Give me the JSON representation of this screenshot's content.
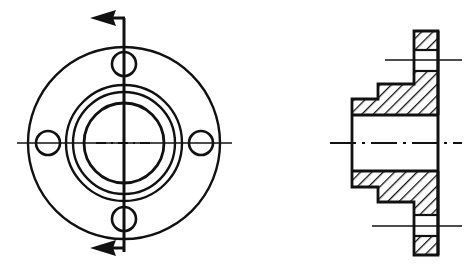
{
  "document": {
    "type": "engineering-drawing",
    "title": "Flanged Hub — Front View and Sectional View",
    "background_color": "#ffffff",
    "line_color": "#111111",
    "width": 465,
    "height": 269
  },
  "views": {
    "front": {
      "name": "front-view",
      "center": {
        "x": 124,
        "y": 143
      },
      "outer_flange_circle": {
        "cx": 124,
        "cy": 143,
        "r": 96
      },
      "concentric_circles": [
        {
          "cx": 124,
          "cy": 143,
          "r": 58
        },
        {
          "cx": 124,
          "cy": 143,
          "r": 51
        },
        {
          "cx": 124,
          "cy": 143,
          "r": 40
        }
      ],
      "bolt_holes": [
        {
          "name": "bolt-hole-top",
          "cx": 124,
          "cy": 64,
          "r": 12
        },
        {
          "name": "bolt-hole-bottom",
          "cx": 124,
          "cy": 219,
          "r": 12
        },
        {
          "name": "bolt-hole-left",
          "cx": 48,
          "cy": 143,
          "r": 12
        },
        {
          "name": "bolt-hole-right",
          "cx": 201,
          "cy": 143,
          "r": 12
        }
      ],
      "horizontal_centerline": {
        "x1": 17,
        "x2": 232,
        "y": 143
      },
      "vertical_dashdot_centerline": {
        "x": 124,
        "y1": 108,
        "y2": 180
      }
    },
    "section_cut": {
      "name": "section-cut-line",
      "line": {
        "x": 124,
        "y1": 18,
        "y2": 252
      },
      "arrow_direction": "left",
      "arrows": [
        {
          "name": "section-arrow-top",
          "tip_x": 95,
          "tail_x": 124,
          "y": 18
        },
        {
          "name": "section-arrow-bottom",
          "tip_x": 95,
          "tail_x": 124,
          "y": 248
        }
      ]
    },
    "section": {
      "name": "sectional-view",
      "center_y": 143,
      "face_plate_right_x": 438,
      "hub_left_x": 352,
      "hatch_angle_deg": 45,
      "centerline": {
        "x1": 330,
        "x2": 462,
        "y": 143
      },
      "bolt_hole_centerlines": [
        {
          "name": "section-bolthole-centerline-top",
          "x1": 385,
          "x2": 462,
          "y": 60
        },
        {
          "name": "section-bolthole-centerline-bottom",
          "x1": 372,
          "x2": 462,
          "y": 226
        }
      ],
      "bolt_hole_gaps": [
        {
          "name": "section-bolthole-gap-top",
          "x1": 415,
          "x2": 438,
          "y1": 50,
          "y2": 71
        },
        {
          "name": "section-bolthole-gap-bottom",
          "x1": 415,
          "x2": 438,
          "y1": 215,
          "y2": 236
        }
      ],
      "profile_upper_outline": "M352,115 L352,99 L378,99 L378,84 L414,84 L414,31 L438,31 L438,115 Z",
      "profile_lower_outline": "M352,171 L352,187 L378,187 L378,202 L414,202 L414,255 L438,255 L438,171 Z",
      "bore_region": {
        "x1": 352,
        "x2": 438,
        "y1": 115,
        "y2": 171
      }
    }
  },
  "labels": {
    "section_label": "",
    "dimensions": []
  }
}
